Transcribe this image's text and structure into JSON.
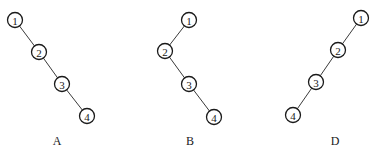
{
  "diagram": {
    "node_radius": 7.5,
    "trees": [
      {
        "label": "A",
        "label_pos": [
          57,
          141
        ],
        "nodes": [
          {
            "id": "1",
            "x": 15,
            "y": 20
          },
          {
            "id": "2",
            "x": 39,
            "y": 52
          },
          {
            "id": "3",
            "x": 62,
            "y": 84
          },
          {
            "id": "4",
            "x": 87,
            "y": 116
          }
        ],
        "edges": [
          [
            "1",
            "2"
          ],
          [
            "2",
            "3"
          ],
          [
            "3",
            "4"
          ]
        ]
      },
      {
        "label": "B",
        "label_pos": [
          190,
          141
        ],
        "nodes": [
          {
            "id": "1",
            "x": 189,
            "y": 20
          },
          {
            "id": "2",
            "x": 165,
            "y": 51
          },
          {
            "id": "3",
            "x": 189,
            "y": 84
          },
          {
            "id": "4",
            "x": 214,
            "y": 117
          }
        ],
        "edges": [
          [
            "1",
            "2"
          ],
          [
            "2",
            "3"
          ],
          [
            "3",
            "4"
          ]
        ]
      },
      {
        "label": "D",
        "label_pos": [
          335,
          141
        ],
        "nodes": [
          {
            "id": "1",
            "x": 361,
            "y": 18
          },
          {
            "id": "2",
            "x": 338,
            "y": 50
          },
          {
            "id": "3",
            "x": 316,
            "y": 82
          },
          {
            "id": "4",
            "x": 293,
            "y": 115
          }
        ],
        "edges": [
          [
            "1",
            "2"
          ],
          [
            "2",
            "3"
          ],
          [
            "3",
            "4"
          ]
        ]
      }
    ]
  }
}
